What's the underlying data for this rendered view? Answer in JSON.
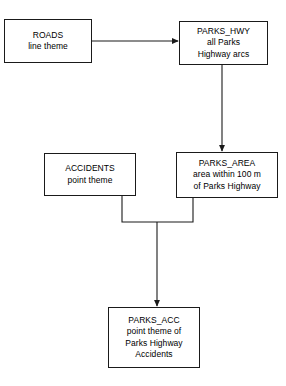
{
  "diagram": {
    "background_color": "#ffffff",
    "stroke_color": "#1a1a1a",
    "text_color": "#000000",
    "nodes": [
      {
        "id": "roads",
        "lines": [
          "ROADS",
          "line theme"
        ],
        "line1": "ROADS",
        "line2": "line theme",
        "line3": "",
        "line4": ""
      },
      {
        "id": "parks_hwy",
        "lines": [
          "PARKS_HWY",
          "all Parks",
          "Highway arcs"
        ],
        "line1": "PARKS_HWY",
        "line2": "all Parks",
        "line3": "Highway arcs",
        "line4": ""
      },
      {
        "id": "accidents",
        "lines": [
          "ACCIDENTS",
          "point theme"
        ],
        "line1": "ACCIDENTS",
        "line2": "point theme",
        "line3": "",
        "line4": ""
      },
      {
        "id": "parks_area",
        "lines": [
          "PARKS_AREA",
          "area within 100 m",
          "of Parks Highway"
        ],
        "line1": "PARKS_AREA",
        "line2": "area within 100 m",
        "line3": "of Parks Highway",
        "line4": ""
      },
      {
        "id": "parks_acc",
        "lines": [
          "PARKS_ACC",
          "point theme of",
          "Parks Highway",
          "Accidents"
        ],
        "line1": "PARKS_ACC",
        "line2": "point theme of",
        "line3": "Parks Highway",
        "line4": "Accidents"
      }
    ],
    "connectors": [
      {
        "id": "roads-to-parks-hwy",
        "from": "roads",
        "to": "parks_hwy",
        "style": "horizontal-arrow"
      },
      {
        "id": "parks-hwy-to-parks-area",
        "from": "parks_hwy",
        "to": "parks_area",
        "style": "vertical-arrow"
      },
      {
        "id": "accidents-to-junction",
        "from": "accidents",
        "to": "junction",
        "style": "elbow"
      },
      {
        "id": "parks-area-to-junction",
        "from": "parks_area",
        "to": "junction",
        "style": "elbow"
      },
      {
        "id": "junction-to-parks-acc",
        "from": "junction",
        "to": "parks_acc",
        "style": "vertical-arrow"
      }
    ]
  }
}
